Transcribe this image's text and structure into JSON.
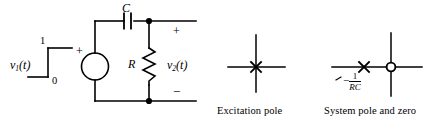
{
  "figure": {
    "background_color": "#ffffff",
    "line_color": "#000000"
  },
  "circuit": {
    "source_label_v": "v",
    "source_label_sub": "1",
    "source_label_arg": "(t)",
    "step_high_label": "1",
    "step_low_label": "0",
    "source_polarity_plus": "+",
    "capacitor_label": "C",
    "resistor_label": "R",
    "output_label_v": "v",
    "output_label_sub": "2",
    "output_label_arg": "(t)",
    "output_polarity_plus": "+",
    "output_polarity_minus": "−",
    "source_symbol": "voltage-source-circle",
    "node_dots": 2
  },
  "plots": [
    {
      "id": "excitation",
      "caption": "Excitation pole",
      "pole_marker": "x",
      "poles": [
        {
          "re": 0,
          "im": 0,
          "label": ""
        }
      ],
      "zeros": [],
      "axes": {
        "horizontal": true,
        "vertical": true
      }
    },
    {
      "id": "system",
      "caption": "System pole and zero",
      "pole_marker": "x",
      "zero_marker": "o",
      "poles": [
        {
          "re": -1,
          "im": 0,
          "label_minus": "−",
          "label_num": "1",
          "label_den": "RC"
        }
      ],
      "zeros": [
        {
          "re": 0,
          "im": 0,
          "label": ""
        }
      ],
      "axes": {
        "horizontal": true,
        "vertical": true
      }
    }
  ]
}
